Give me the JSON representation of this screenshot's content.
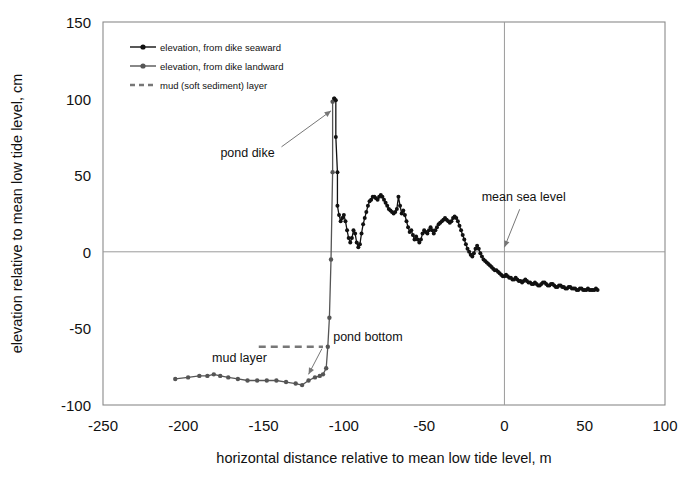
{
  "chart_data": {
    "type": "line",
    "title": "",
    "xlabel": "horizontal distance relative to mean low tide level, m",
    "ylabel": "elevation relative to mean low tide level, cm",
    "xlim": [
      -250,
      100
    ],
    "ylim": [
      -100,
      150
    ],
    "xticks": [
      "-250",
      "-200",
      "-150",
      "-100",
      "-50",
      "0",
      "50",
      "100"
    ],
    "yticks": [
      "150",
      "100",
      "50",
      "0",
      "-50",
      "-100"
    ],
    "grid": "horizontal line at y=0 and vertical line at x=0 only",
    "legend_position": "top-left inside axes",
    "legend": [
      {
        "label": "elevation, from dike seaward",
        "marker": "filled-circle",
        "line": "solid",
        "color": "#111111"
      },
      {
        "label": "elevation, from dike landward",
        "marker": "filled-circle",
        "line": "solid",
        "color": "#555555"
      },
      {
        "label": "mud (soft sediment) layer",
        "marker": "none",
        "line": "dashed",
        "color": "#777777"
      }
    ],
    "annotations": [
      {
        "text": "pond dike",
        "x": -160,
        "y": 62,
        "arrow_to": [
          -108,
          92
        ]
      },
      {
        "text": "mean sea level",
        "x": 12,
        "y": 33,
        "arrow_to": [
          0,
          3
        ]
      },
      {
        "text": "mud layer",
        "x": -165,
        "y": -72,
        "arrow_to": null
      },
      {
        "text": "pond bottom",
        "x": -85,
        "y": -58,
        "arrow_to": [
          -122,
          -80
        ]
      }
    ],
    "series": [
      {
        "name": "elevation, from dike landward",
        "color": "#555555",
        "points": [
          [
            -205,
            -83
          ],
          [
            -197,
            -82
          ],
          [
            -190,
            -81
          ],
          [
            -185,
            -81
          ],
          [
            -181,
            -80
          ],
          [
            -177,
            -81
          ],
          [
            -172,
            -82
          ],
          [
            -166,
            -83
          ],
          [
            -160,
            -84
          ],
          [
            -154,
            -84
          ],
          [
            -148,
            -84
          ],
          [
            -142,
            -84
          ],
          [
            -136,
            -85
          ],
          [
            -130,
            -86
          ],
          [
            -126,
            -87
          ],
          [
            -122,
            -84
          ],
          [
            -118,
            -82
          ],
          [
            -115,
            -81
          ],
          [
            -113,
            -80
          ],
          [
            -111,
            -76
          ],
          [
            -110,
            -62
          ],
          [
            -109,
            -43
          ],
          [
            -108,
            -5
          ],
          [
            -107,
            52
          ],
          [
            -107,
            98
          ],
          [
            -106,
            100
          ]
        ]
      },
      {
        "name": "elevation, from dike seaward",
        "color": "#111111",
        "points": [
          [
            -106,
            100
          ],
          [
            -105,
            99
          ],
          [
            -105,
            75
          ],
          [
            -104,
            52
          ],
          [
            -104,
            30
          ],
          [
            -103,
            24
          ],
          [
            -102,
            20
          ],
          [
            -101,
            22
          ],
          [
            -100,
            24
          ],
          [
            -99,
            20
          ],
          [
            -98,
            14
          ],
          [
            -97,
            9
          ],
          [
            -96,
            6
          ],
          [
            -95,
            9
          ],
          [
            -94,
            14
          ],
          [
            -93,
            12
          ],
          [
            -92,
            6
          ],
          [
            -91,
            3
          ],
          [
            -90,
            5
          ],
          [
            -89,
            12
          ],
          [
            -88,
            18
          ],
          [
            -87,
            22
          ],
          [
            -86,
            26
          ],
          [
            -85,
            30
          ],
          [
            -84,
            33
          ],
          [
            -83,
            34
          ],
          [
            -82,
            36
          ],
          [
            -81,
            36
          ],
          [
            -80,
            35
          ],
          [
            -79,
            34
          ],
          [
            -78,
            36
          ],
          [
            -77,
            37
          ],
          [
            -76,
            36
          ],
          [
            -75,
            34
          ],
          [
            -74,
            32
          ],
          [
            -73,
            30
          ],
          [
            -72,
            28
          ],
          [
            -71,
            27
          ],
          [
            -70,
            26
          ],
          [
            -69,
            25
          ],
          [
            -68,
            26
          ],
          [
            -67,
            28
          ],
          [
            -66,
            36
          ],
          [
            -65,
            30
          ],
          [
            -64,
            25
          ],
          [
            -63,
            27
          ],
          [
            -62,
            24
          ],
          [
            -61,
            20
          ],
          [
            -60,
            16
          ],
          [
            -59,
            13
          ],
          [
            -58,
            14
          ],
          [
            -57,
            11
          ],
          [
            -56,
            8
          ],
          [
            -55,
            10
          ],
          [
            -54,
            8
          ],
          [
            -53,
            6
          ],
          [
            -52,
            8
          ],
          [
            -51,
            12
          ],
          [
            -50,
            14
          ],
          [
            -49,
            13
          ],
          [
            -48,
            12
          ],
          [
            -47,
            14
          ],
          [
            -46,
            16
          ],
          [
            -45,
            14
          ],
          [
            -44,
            12
          ],
          [
            -43,
            14
          ],
          [
            -42,
            16
          ],
          [
            -41,
            18
          ],
          [
            -40,
            19
          ],
          [
            -39,
            20
          ],
          [
            -38,
            21
          ],
          [
            -37,
            22
          ],
          [
            -36,
            21
          ],
          [
            -35,
            20
          ],
          [
            -34,
            19
          ],
          [
            -33,
            20
          ],
          [
            -32,
            22
          ],
          [
            -31,
            23
          ],
          [
            -30,
            22
          ],
          [
            -29,
            20
          ],
          [
            -28,
            17
          ],
          [
            -27,
            14
          ],
          [
            -26,
            11
          ],
          [
            -25,
            8
          ],
          [
            -24,
            5
          ],
          [
            -23,
            2
          ],
          [
            -22,
            0
          ],
          [
            -21,
            -2
          ],
          [
            -20,
            -3
          ],
          [
            -19,
            -1
          ],
          [
            -18,
            2
          ],
          [
            -17,
            4
          ],
          [
            -16,
            2
          ],
          [
            -15,
            -1
          ],
          [
            -14,
            -3
          ],
          [
            -13,
            -5
          ],
          [
            -12,
            -6
          ],
          [
            -11,
            -7
          ],
          [
            -10,
            -8
          ],
          [
            -9,
            -9
          ],
          [
            -8,
            -10
          ],
          [
            -7,
            -11
          ],
          [
            -6,
            -12
          ],
          [
            -5,
            -12
          ],
          [
            -4,
            -13
          ],
          [
            -3,
            -14
          ],
          [
            -2,
            -15
          ],
          [
            -1,
            -16
          ],
          [
            0,
            -16
          ],
          [
            1,
            -15
          ],
          [
            2,
            -16
          ],
          [
            3,
            -17
          ],
          [
            4,
            -17
          ],
          [
            5,
            -18
          ],
          [
            6,
            -18
          ],
          [
            7,
            -17
          ],
          [
            8,
            -18
          ],
          [
            9,
            -19
          ],
          [
            10,
            -19
          ],
          [
            11,
            -20
          ],
          [
            12,
            -19
          ],
          [
            13,
            -18
          ],
          [
            14,
            -19
          ],
          [
            15,
            -20
          ],
          [
            16,
            -20
          ],
          [
            17,
            -21
          ],
          [
            18,
            -21
          ],
          [
            19,
            -20
          ],
          [
            20,
            -21
          ],
          [
            21,
            -22
          ],
          [
            22,
            -22
          ],
          [
            23,
            -21
          ],
          [
            24,
            -20
          ],
          [
            25,
            -20
          ],
          [
            26,
            -21
          ],
          [
            27,
            -22
          ],
          [
            28,
            -22
          ],
          [
            29,
            -21
          ],
          [
            30,
            -21
          ],
          [
            31,
            -22
          ],
          [
            32,
            -23
          ],
          [
            33,
            -23
          ],
          [
            34,
            -22
          ],
          [
            35,
            -22
          ],
          [
            36,
            -23
          ],
          [
            37,
            -23
          ],
          [
            38,
            -24
          ],
          [
            39,
            -24
          ],
          [
            40,
            -23
          ],
          [
            41,
            -23
          ],
          [
            42,
            -24
          ],
          [
            43,
            -24
          ],
          [
            44,
            -24
          ],
          [
            45,
            -25
          ],
          [
            46,
            -25
          ],
          [
            47,
            -24
          ],
          [
            48,
            -24
          ],
          [
            49,
            -25
          ],
          [
            50,
            -25
          ],
          [
            51,
            -25
          ],
          [
            52,
            -24
          ],
          [
            53,
            -25
          ],
          [
            54,
            -25
          ],
          [
            55,
            -25
          ],
          [
            56,
            -25
          ],
          [
            57,
            -24
          ],
          [
            58,
            -25
          ]
        ]
      },
      {
        "name": "mud (soft sediment) layer",
        "color": "#777777",
        "style": "dashed",
        "points": [
          [
            -153,
            -62
          ],
          [
            -113,
            -62
          ]
        ]
      }
    ]
  }
}
